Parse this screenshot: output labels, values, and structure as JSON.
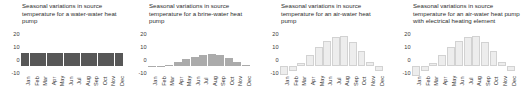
{
  "figure": {
    "background": "#ffffff",
    "panel_count": 4
  },
  "chart_data": [
    {
      "type": "bar",
      "title": "Seasonal variations in source temperature for a water-water heat pump",
      "xlabel": "",
      "ylabel": "",
      "ylim": [
        -10,
        25
      ],
      "yticks": [
        20,
        10,
        0,
        -10
      ],
      "grid": false,
      "legend": "none",
      "bar_color": "#575757",
      "categories": [
        "Jan",
        "Feb",
        "Mar",
        "Apr",
        "May",
        "Jun",
        "Jul",
        "Aug",
        "Sep",
        "Oct",
        "Nov",
        "Dec"
      ],
      "values": [
        10,
        10,
        10,
        10,
        10,
        10,
        10,
        10,
        10,
        10,
        10,
        10
      ]
    },
    {
      "type": "bar",
      "title": "Seasonal variations in source temperature for a brine-water heat pump",
      "xlabel": "",
      "ylabel": "",
      "ylim": [
        -10,
        25
      ],
      "yticks": [
        20,
        10,
        0,
        -10
      ],
      "grid": false,
      "legend": "none",
      "bar_color": "#ababab",
      "categories": [
        "Jan",
        "Feb",
        "Mar",
        "Apr",
        "May",
        "Jun",
        "Jul",
        "Aug",
        "Sep",
        "Oct",
        "Nov",
        "Dec"
      ],
      "values": [
        0,
        0,
        1,
        3,
        5,
        7,
        8,
        9,
        8,
        6,
        3,
        1
      ]
    },
    {
      "type": "bar",
      "title": "Seasonal variations in source temperature for an air-water heat pump",
      "xlabel": "",
      "ylabel": "",
      "ylim": [
        -10,
        25
      ],
      "yticks": [
        20,
        10,
        0,
        -10
      ],
      "grid": false,
      "legend": "none",
      "bar_color": "#ededed",
      "categories": [
        "Jan",
        "Feb",
        "Mar",
        "Apr",
        "May",
        "Jun",
        "Jul",
        "Aug",
        "Sep",
        "Oct",
        "Nov",
        "Dec"
      ],
      "values": [
        -7,
        -4,
        2,
        8,
        14,
        19,
        22,
        23,
        18,
        11,
        3,
        -4
      ]
    },
    {
      "type": "bar",
      "title": "Seasonal variations in source temperature for an air-water heat pump with electrical heating element",
      "xlabel": "",
      "ylabel": "",
      "ylim": [
        -10,
        25
      ],
      "yticks": [
        20,
        10,
        0,
        -10
      ],
      "grid": false,
      "legend": "none",
      "bar_color": "#ededed",
      "categories": [
        "Jan",
        "Feb",
        "Mar",
        "Apr",
        "May",
        "Jun",
        "Jul",
        "Aug",
        "Sep",
        "Oct",
        "Nov",
        "Dec"
      ],
      "values": [
        -8,
        -4,
        2,
        8,
        14,
        19,
        22,
        23,
        18,
        11,
        3,
        -4
      ]
    }
  ]
}
